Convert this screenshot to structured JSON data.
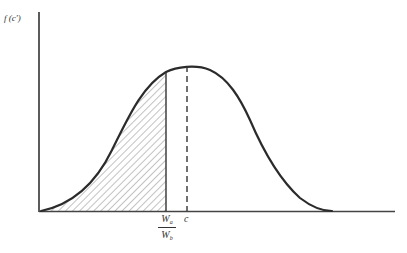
{
  "figure": {
    "y_axis_label": "f (c')",
    "x_labels": {
      "fraction_numerator": "W",
      "fraction_numerator_sub": "a",
      "fraction_denominator": "W",
      "fraction_denominator_sub": "b",
      "mean_label": "c"
    },
    "curve": {
      "type": "bell-shaped density",
      "peak_at": "c",
      "shaded_region": "area under curve left of W_a/W_b",
      "shading": "diagonal hatching"
    },
    "colors": {
      "stroke": "#333333",
      "hatch": "#555555",
      "background": "#ffffff"
    }
  }
}
